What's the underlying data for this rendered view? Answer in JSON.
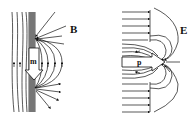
{
  "panels": [
    {
      "id": "magnetic",
      "field_label": "B",
      "dipole_label": "m",
      "dipole_direction": "down"
    },
    {
      "id": "electric",
      "field_label": "E",
      "dipole_label": "p",
      "dipole_direction": "right"
    }
  ],
  "colors": {
    "ink": "#111111",
    "background": "#ffffff"
  }
}
